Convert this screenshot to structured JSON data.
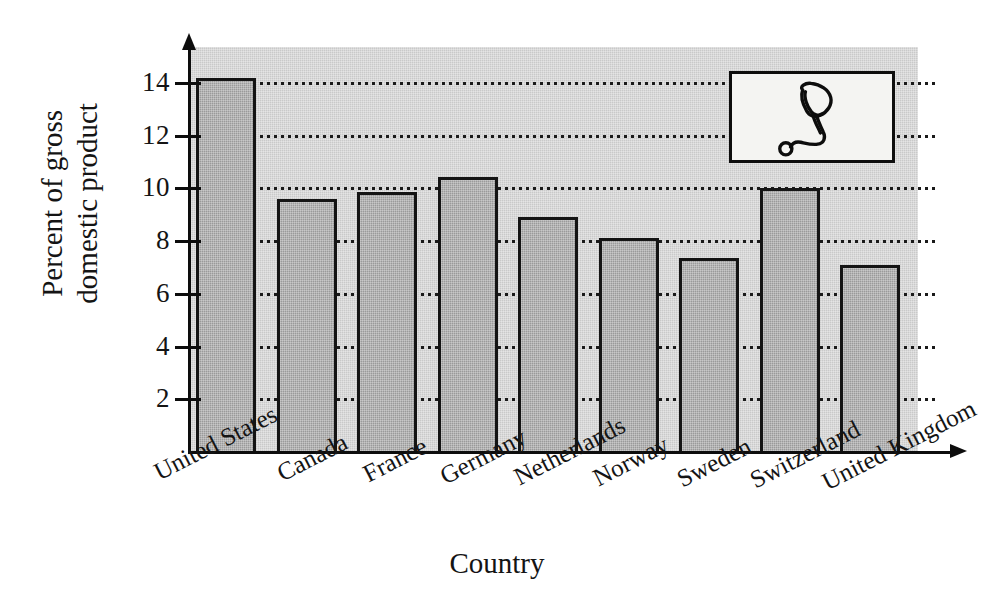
{
  "chart_data": {
    "type": "bar",
    "title": "",
    "subtitle": "",
    "xlabel": "Country",
    "ylabel_lines": [
      "Percent of gross",
      "domestic product"
    ],
    "ylabel": "Percent of gross domestic product",
    "categories": [
      "United States",
      "Canada",
      "France",
      "Germany",
      "Netherlands",
      "Norway",
      "Sweden",
      "Switzerland",
      "United Kingdom"
    ],
    "values": [
      14.2,
      9.6,
      9.85,
      10.45,
      8.9,
      8.1,
      7.35,
      10.0,
      7.1
    ],
    "ylim": [
      0,
      15.3
    ],
    "yticks": [
      2,
      4,
      6,
      8,
      10,
      12,
      14
    ],
    "ytick_labels": [
      "2",
      "4",
      "6",
      "8",
      "10",
      "12",
      "14"
    ],
    "grid": "horizontal-dotted",
    "legend": "none",
    "annotation_icon": "stethoscope-icon",
    "colors": {
      "bar_fill": "#9a9a9a",
      "bar_edge": "#141414",
      "plot_background": "#c9c9c9",
      "axis": "#0d0d0d",
      "gridline": "#1a1a1a",
      "inset_background": "#f4f4f2",
      "page_background": "#ffffff"
    }
  },
  "inset": {
    "icon_name": "stethoscope-icon"
  }
}
